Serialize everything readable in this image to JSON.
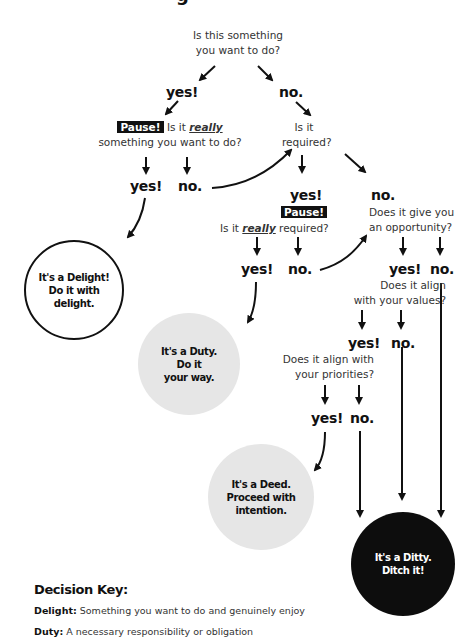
{
  "title_fragment": "g",
  "nodes": {
    "q1": {
      "line1": "Is this something",
      "line2": "you want to do?"
    },
    "a1_yes": "yes!",
    "a1_no": "no.",
    "q2": {
      "pause": "Pause!",
      "pre": "Is it",
      "emph": "really",
      "line2": "something you want to do?"
    },
    "a2_yes": "yes!",
    "a2_no": "no.",
    "q3": {
      "line1": "Is it",
      "line2": "required?"
    },
    "a3_yes": "yes!",
    "a3_no": "no.",
    "q4": {
      "pause": "Pause!",
      "pre": "Is it",
      "emph": "really",
      "post": "required?"
    },
    "a4_yes": "yes!",
    "a4_no": "no.",
    "q5": {
      "line1": "Does it give you",
      "line2": "an opportunity?"
    },
    "a5_yes": "yes!",
    "a5_no": "no.",
    "q6": {
      "line1": "Does it align",
      "line2": "with your values?"
    },
    "a6_yes": "yes!",
    "a6_no": "no.",
    "q7": {
      "line1": "Does it align with",
      "line2": "your priorities?"
    },
    "a7_yes": "yes!",
    "a7_no": "no."
  },
  "outcomes": {
    "delight": {
      "line1": "It's a Delight!",
      "line2": "Do it with",
      "line3": "delight.",
      "fill": "#ffffff"
    },
    "duty": {
      "line1": "It's a Duty.",
      "line2": "Do it",
      "line3": "your way.",
      "fill": "#e6e6e6"
    },
    "deed": {
      "line1": "It's a Deed.",
      "line2": "Proceed with",
      "line3": "intention.",
      "fill": "#e6e6e6"
    },
    "ditty": {
      "line1": "It's a Ditty.",
      "line2": "Ditch it!",
      "fill": "#0d0d0d"
    }
  },
  "key": {
    "title": "Decision Key:",
    "items": [
      {
        "term": "Delight:",
        "definition": "Something you want to do and genuinely enjoy"
      },
      {
        "term": "Duty:",
        "definition": "A necessary responsibility or obligation"
      }
    ]
  }
}
